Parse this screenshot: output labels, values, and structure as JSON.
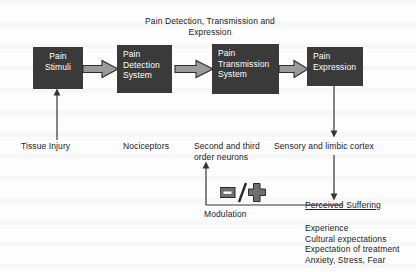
{
  "figure": {
    "title": "Pain Detection, Transmission and Expression"
  },
  "flow": {
    "boxes": [
      {
        "id": "pain-stimuli",
        "lines": [
          "Pain",
          "Stimuli"
        ],
        "align": "center"
      },
      {
        "id": "pain-detection",
        "lines": [
          "Pain",
          "Detection",
          "System"
        ],
        "align": "left"
      },
      {
        "id": "pain-transmission",
        "lines": [
          "Pain",
          "Transmission",
          "System"
        ],
        "align": "left"
      },
      {
        "id": "pain-expression",
        "lines": [
          "Pain",
          "Expression"
        ],
        "align": "left"
      }
    ],
    "arrow_icon_name": "block-arrow-right-icon",
    "arrow_fill": "#9a9a9a",
    "arrow_stroke": "#2e2e2e",
    "box_fill": "#3a3a3a",
    "box_text_color": "#ffffff"
  },
  "annotations": {
    "tissue_injury": "Tissue Injury",
    "nociceptors": "Nociceptors",
    "second_third_order_neurons": [
      "Second and third",
      "order neurons"
    ],
    "sensory_limbic_cortex": "Sensory and limbic cortex",
    "modulation": "Modulation",
    "modulation_symbol": {
      "minus": "−",
      "slash": "/",
      "plus": "+"
    },
    "perceived_suffering": "Perceived Suffering",
    "suffering_factors": [
      "Experience",
      "Cultural expectations",
      "Expectation of treatment",
      "Anxiety, Stress, Fear"
    ]
  },
  "colors": {
    "line": "#343434",
    "text": "#1b1b1b",
    "background": "#fdfdfd"
  }
}
